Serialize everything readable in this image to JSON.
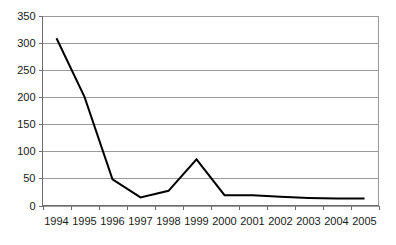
{
  "chart_data": {
    "type": "line",
    "title": "",
    "subtitle": "",
    "xlabel": "",
    "ylabel": "",
    "categories": [
      "1994",
      "1995",
      "1996",
      "1997",
      "1998",
      "1999",
      "2000",
      "2001",
      "2002",
      "2003",
      "2004",
      "2005"
    ],
    "values": [
      308,
      200,
      48,
      15,
      27,
      85,
      19,
      19,
      16,
      14,
      13,
      13
    ],
    "series": [
      {
        "name": "",
        "values": [
          308,
          200,
          48,
          15,
          27,
          85,
          19,
          19,
          16,
          14,
          13,
          13
        ]
      }
    ],
    "ylim": [
      0,
      350
    ],
    "ytick_values": [
      0,
      50,
      100,
      150,
      200,
      250,
      300,
      350
    ],
    "ytick_labels": [
      "0",
      "50",
      "100",
      "150",
      "200",
      "250",
      "300",
      "350"
    ],
    "xtick_labels": [
      "1994",
      "1995",
      "1996",
      "1997",
      "1998",
      "1999",
      "2000",
      "2001",
      "2002",
      "2003",
      "2004",
      "2005"
    ],
    "grid": true,
    "grid_axis": "y",
    "legend": false,
    "legend_position": "none",
    "annotations": [],
    "colors": {
      "line": "#000000",
      "grid": "#9a9a9a",
      "axis": "#6e6e6e",
      "background": "#ffffff",
      "text": "#1a1a1a"
    }
  }
}
